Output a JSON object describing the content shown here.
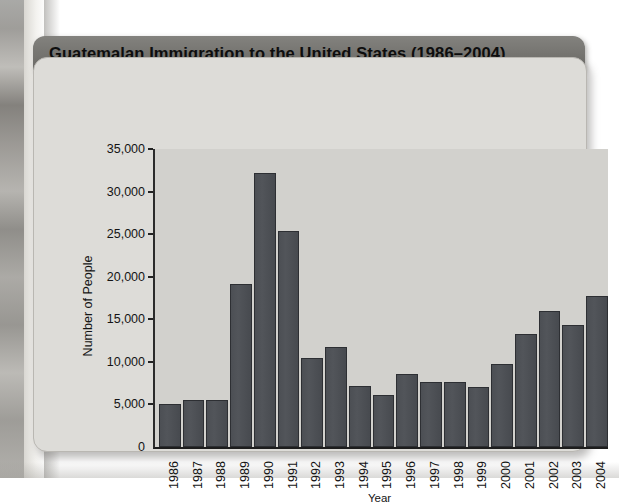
{
  "figure": {
    "title": "Guatemalan Immigration to the United States (1986–2004)",
    "card_bg": "#dddcd8",
    "title_bar_bg": "#767571",
    "plot_bg": "#d2d1cd",
    "bar_color": "#4c4f54",
    "axis_color": "#232323"
  },
  "chart_data": {
    "type": "bar",
    "title": "Guatemalan Immigration to the United States (1986–2004)",
    "xlabel": "Year",
    "ylabel": "Number of People",
    "categories": [
      "1986",
      "1987",
      "1988",
      "1989",
      "1990",
      "1991",
      "1992",
      "1993",
      "1994",
      "1995",
      "1996",
      "1997",
      "1998",
      "1999",
      "2000",
      "2001",
      "2002",
      "2003",
      "2004"
    ],
    "values": [
      5100,
      5500,
      5500,
      19100,
      32200,
      25400,
      10400,
      11700,
      7200,
      6100,
      8600,
      7600,
      7600,
      7100,
      9800,
      13300,
      16000,
      14300,
      17700
    ],
    "ylim": [
      0,
      35000
    ],
    "ytick_values": [
      0,
      5000,
      10000,
      15000,
      20000,
      25000,
      30000,
      35000
    ],
    "ytick_labels": [
      "0",
      "5,000",
      "10,000",
      "15,000",
      "20,000",
      "25,000",
      "30,000",
      "35,000"
    ],
    "grid": false,
    "legend": null
  }
}
